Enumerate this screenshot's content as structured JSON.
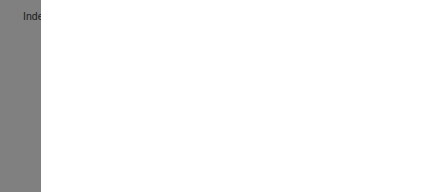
{
  "chart_data": {
    "type": "bar",
    "orientation": "horizontal",
    "title": "",
    "subtitle": "",
    "xlabel": "",
    "ylabel": "",
    "categories": [
      "Independent living difficulty",
      "Self-care difficulty",
      "Ambulatory difficulty",
      "Cognitive difficulty",
      "Vision difficulty",
      "Hearing difficulty",
      "Any disability"
    ],
    "values": [
      15,
      9,
      23,
      9,
      7,
      15,
      36
    ],
    "value_labels": [
      "15",
      "9",
      "23",
      "9",
      "7",
      "15",
      "36"
    ],
    "bar_colors": [
      "#808080",
      "#8c8c8c",
      "#b8b8b8",
      "#b0b0b0",
      "#787878",
      "#dcdcdc",
      "#707070"
    ],
    "xlim": [
      0,
      100
    ],
    "xticks": [
      0,
      20,
      40,
      60,
      80,
      100
    ],
    "xtick_labels": [
      "0",
      "20",
      "40",
      "60",
      "80",
      "100"
    ],
    "grid": false,
    "legend": null,
    "frame": true,
    "axis_color": "#1a1a1a",
    "background": "#ffffff"
  }
}
